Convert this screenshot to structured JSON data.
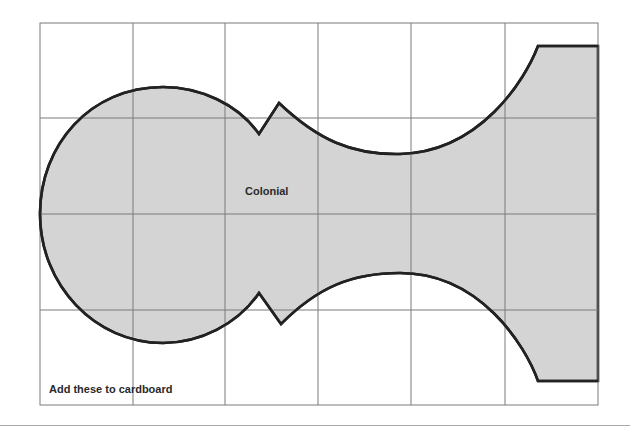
{
  "diagram": {
    "shape_label": "Colonial",
    "note": "Add these to cardboard",
    "colors": {
      "grid": "#7a7a7a",
      "shape_fill": "#d4d4d4",
      "shape_outline": "#222222",
      "background": "#ffffff"
    },
    "grid": {
      "columns": 6,
      "rows": 4
    }
  }
}
